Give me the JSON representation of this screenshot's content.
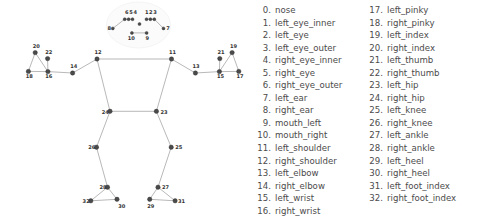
{
  "legend": {
    "columns": [
      {
        "name": "legend-column-left",
        "items": [
          {
            "index": "0.",
            "label": "nose"
          },
          {
            "index": "1.",
            "label": "left_eye_inner"
          },
          {
            "index": "2.",
            "label": "left_eye"
          },
          {
            "index": "3.",
            "label": "left_eye_outer"
          },
          {
            "index": "4.",
            "label": "right_eye_inner"
          },
          {
            "index": "5.",
            "label": "right_eye"
          },
          {
            "index": "6.",
            "label": "right_eye_outer"
          },
          {
            "index": "7.",
            "label": "left_ear"
          },
          {
            "index": "8.",
            "label": "right_ear"
          },
          {
            "index": "9.",
            "label": "mouth_left"
          },
          {
            "index": "10.",
            "label": "mouth_right"
          },
          {
            "index": "11.",
            "label": "left_shoulder"
          },
          {
            "index": "12.",
            "label": "right_shoulder"
          },
          {
            "index": "13.",
            "label": "left_elbow"
          },
          {
            "index": "14.",
            "label": "right_elbow"
          },
          {
            "index": "15.",
            "label": "left_wrist"
          },
          {
            "index": "16.",
            "label": "right_wrist"
          }
        ]
      },
      {
        "name": "legend-column-right",
        "items": [
          {
            "index": "17.",
            "label": "left_pinky"
          },
          {
            "index": "18.",
            "label": "right_pinky"
          },
          {
            "index": "19.",
            "label": "left_index"
          },
          {
            "index": "20.",
            "label": "right_index"
          },
          {
            "index": "21.",
            "label": "left_thumb"
          },
          {
            "index": "22.",
            "label": "right_thumb"
          },
          {
            "index": "23.",
            "label": "left_hip"
          },
          {
            "index": "24.",
            "label": "right_hip"
          },
          {
            "index": "25.",
            "label": "left_knee"
          },
          {
            "index": "26.",
            "label": "right_knee"
          },
          {
            "index": "27.",
            "label": "left_ankle"
          },
          {
            "index": "28.",
            "label": "right_ankle"
          },
          {
            "index": "29.",
            "label": "left_heel"
          },
          {
            "index": "30.",
            "label": "right_heel"
          },
          {
            "index": "31.",
            "label": "left_foot_index"
          },
          {
            "index": "32.",
            "label": "right_foot_index"
          }
        ]
      }
    ]
  },
  "diagram": {
    "colors": {
      "node_fill": "#4a4a4a",
      "edge_stroke": "#9a9a9a",
      "label_fill": "#333333",
      "background": "#ffffff"
    },
    "landmarks": [
      {
        "id": 0,
        "name": "nose",
        "x": 139.5,
        "y": 24.0,
        "label": "",
        "lx": 0,
        "ly": 0,
        "hollow": false
      },
      {
        "id": 1,
        "name": "left_eye_inner",
        "x": 146.5,
        "y": 19.2,
        "label": "1",
        "lx": 145.0,
        "ly": 13.6,
        "hollow": false
      },
      {
        "id": 2,
        "name": "left_eye",
        "x": 150.4,
        "y": 19.2,
        "label": "2",
        "lx": 149.1,
        "ly": 13.6,
        "hollow": false
      },
      {
        "id": 3,
        "name": "left_eye_outer",
        "x": 154.3,
        "y": 19.2,
        "label": "3",
        "lx": 153.2,
        "ly": 13.6,
        "hollow": false
      },
      {
        "id": 4,
        "name": "right_eye_inner",
        "x": 132.5,
        "y": 19.2,
        "label": "4",
        "lx": 133.6,
        "ly": 13.6,
        "hollow": false
      },
      {
        "id": 5,
        "name": "right_eye",
        "x": 128.6,
        "y": 19.2,
        "label": "5",
        "lx": 129.3,
        "ly": 13.6,
        "hollow": false
      },
      {
        "id": 6,
        "name": "right_eye_outer",
        "x": 124.7,
        "y": 19.2,
        "label": "6",
        "lx": 125.0,
        "ly": 13.6,
        "hollow": false
      },
      {
        "id": 7,
        "name": "left_ear",
        "x": 163.5,
        "y": 28.4,
        "label": "7",
        "lx": 166.3,
        "ly": 30.4,
        "hollow": false
      },
      {
        "id": 8,
        "name": "right_ear",
        "x": 112.8,
        "y": 28.4,
        "label": "8",
        "lx": 107.5,
        "ly": 30.4,
        "hollow": false
      },
      {
        "id": 9,
        "name": "mouth_left",
        "x": 146.6,
        "y": 32.9,
        "label": "9",
        "lx": 145.4,
        "ly": 39.8,
        "hollow": false
      },
      {
        "id": 10,
        "name": "mouth_right",
        "x": 131.9,
        "y": 32.9,
        "label": "10",
        "lx": 127.8,
        "ly": 39.8,
        "hollow": false
      },
      {
        "id": 11,
        "name": "left_shoulder",
        "x": 171.5,
        "y": 59.0,
        "label": "11",
        "lx": 169.0,
        "ly": 53.8,
        "hollow": false
      },
      {
        "id": 12,
        "name": "right_shoulder",
        "x": 97.0,
        "y": 59.0,
        "label": "12",
        "lx": 94.5,
        "ly": 53.8,
        "hollow": false
      },
      {
        "id": 13,
        "name": "left_elbow",
        "x": 195.4,
        "y": 73.0,
        "label": "13",
        "lx": 192.5,
        "ly": 68.0,
        "hollow": false
      },
      {
        "id": 14,
        "name": "right_elbow",
        "x": 72.6,
        "y": 73.0,
        "label": "14",
        "lx": 70.2,
        "ly": 68.0,
        "hollow": false
      },
      {
        "id": 15,
        "name": "left_wrist",
        "x": 219.4,
        "y": 71.6,
        "label": "15",
        "lx": 217.0,
        "ly": 78.2,
        "hollow": false
      },
      {
        "id": 16,
        "name": "right_wrist",
        "x": 47.9,
        "y": 71.6,
        "label": "16",
        "lx": 45.2,
        "ly": 78.2,
        "hollow": false
      },
      {
        "id": 17,
        "name": "left_pinky",
        "x": 238.8,
        "y": 71.4,
        "label": "17",
        "lx": 236.5,
        "ly": 78.2,
        "hollow": false
      },
      {
        "id": 18,
        "name": "right_pinky",
        "x": 28.4,
        "y": 71.4,
        "label": "18",
        "lx": 25.8,
        "ly": 78.2,
        "hollow": false
      },
      {
        "id": 19,
        "name": "left_index",
        "x": 232.1,
        "y": 52.6,
        "label": "19",
        "lx": 230.0,
        "ly": 47.6,
        "hollow": false
      },
      {
        "id": 20,
        "name": "right_index",
        "x": 35.2,
        "y": 52.6,
        "label": "20",
        "lx": 32.8,
        "ly": 47.6,
        "hollow": false
      },
      {
        "id": 21,
        "name": "left_thumb",
        "x": 219.8,
        "y": 58.6,
        "label": "21",
        "lx": 217.4,
        "ly": 53.6,
        "hollow": false
      },
      {
        "id": 22,
        "name": "right_thumb",
        "x": 47.6,
        "y": 58.6,
        "label": "22",
        "lx": 45.3,
        "ly": 53.6,
        "hollow": false
      },
      {
        "id": 23,
        "name": "left_hip",
        "x": 156.4,
        "y": 111.3,
        "label": "23",
        "lx": 160.5,
        "ly": 113.5,
        "hollow": false
      },
      {
        "id": 24,
        "name": "right_hip",
        "x": 110.0,
        "y": 111.3,
        "label": "24",
        "lx": 101.8,
        "ly": 113.5,
        "hollow": false
      },
      {
        "id": 25,
        "name": "left_knee",
        "x": 171.2,
        "y": 147.2,
        "label": "25",
        "lx": 175.3,
        "ly": 149.3,
        "hollow": false
      },
      {
        "id": 26,
        "name": "right_knee",
        "x": 96.5,
        "y": 147.2,
        "label": "26",
        "lx": 88.2,
        "ly": 149.3,
        "hollow": false
      },
      {
        "id": 27,
        "name": "left_ankle",
        "x": 158.0,
        "y": 187.2,
        "label": "27",
        "lx": 162.0,
        "ly": 189.4,
        "hollow": false
      },
      {
        "id": 28,
        "name": "right_ankle",
        "x": 107.5,
        "y": 187.2,
        "label": "28",
        "lx": 99.5,
        "ly": 189.4,
        "hollow": false
      },
      {
        "id": 29,
        "name": "left_heel",
        "x": 149.7,
        "y": 199.3,
        "label": "29",
        "lx": 147.3,
        "ly": 207.8,
        "hollow": false
      },
      {
        "id": 30,
        "name": "right_heel",
        "x": 117.0,
        "y": 199.3,
        "label": "30",
        "lx": 118.2,
        "ly": 207.8,
        "hollow": false
      },
      {
        "id": 31,
        "name": "left_foot_index",
        "x": 175.1,
        "y": 200.8,
        "label": "31",
        "lx": 178.0,
        "ly": 203.0,
        "hollow": false
      },
      {
        "id": 32,
        "name": "right_foot_index",
        "x": 90.8,
        "y": 200.8,
        "label": "32",
        "lx": 82.6,
        "ly": 203.0,
        "hollow": false
      }
    ],
    "connections": [
      [
        1,
        2
      ],
      [
        2,
        3
      ],
      [
        4,
        5
      ],
      [
        5,
        6
      ],
      [
        3,
        7
      ],
      [
        6,
        8
      ],
      [
        9,
        10
      ],
      [
        11,
        12
      ],
      [
        11,
        13
      ],
      [
        13,
        15
      ],
      [
        15,
        17
      ],
      [
        15,
        19
      ],
      [
        15,
        21
      ],
      [
        17,
        19
      ],
      [
        12,
        14
      ],
      [
        14,
        16
      ],
      [
        16,
        18
      ],
      [
        16,
        20
      ],
      [
        16,
        22
      ],
      [
        18,
        20
      ],
      [
        11,
        23
      ],
      [
        12,
        24
      ],
      [
        23,
        24
      ],
      [
        23,
        25
      ],
      [
        25,
        27
      ],
      [
        27,
        29
      ],
      [
        29,
        31
      ],
      [
        27,
        31
      ],
      [
        24,
        26
      ],
      [
        26,
        28
      ],
      [
        28,
        30
      ],
      [
        30,
        32
      ],
      [
        28,
        32
      ]
    ]
  }
}
